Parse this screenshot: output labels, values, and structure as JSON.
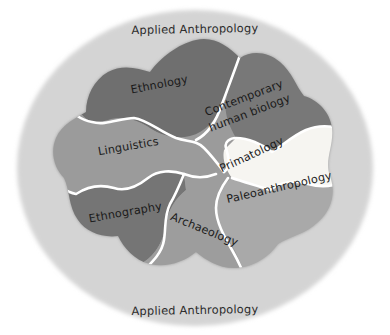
{
  "diagram": {
    "title": "Applied Anthropology",
    "type": "venn-blob-subfield-map",
    "outer_ring": {
      "name": "Applied Anthropology",
      "label_top": "Applied Anthropology",
      "label_bottom": "Applied Anthropology",
      "color": "#d4d4d4"
    },
    "background_color": "#ffffff",
    "divider_color": "#ffffff",
    "regions": [
      {
        "id": "ethnology",
        "label": "Ethnology",
        "color": "#6f6f6f",
        "shade": "dark-gray",
        "rotation": -11,
        "x": 160,
        "y": 88
      },
      {
        "id": "contemporary-human-biology",
        "label_line1": "Contemporary",
        "label_line2": "human biology",
        "label": "Contemporary human biology",
        "color": "#787878",
        "shade": "dark-gray",
        "rotation": -21,
        "x": 247,
        "y": 106
      },
      {
        "id": "linguistics",
        "label": "Linguistics",
        "color": "#9b9b9b",
        "shade": "medium-gray",
        "rotation": -10,
        "x": 129,
        "y": 150
      },
      {
        "id": "primatology",
        "label": "Primatology",
        "color": "#f6f5f1",
        "shade": "near-white",
        "rotation": -25,
        "x": 253,
        "y": 158
      },
      {
        "id": "paleoanthropology",
        "label": "Paleoanthropology",
        "color": "#a9a9a9",
        "shade": "medium-gray",
        "rotation": -13,
        "x": 280,
        "y": 191
      },
      {
        "id": "ethnography",
        "label": "Ethnography",
        "color": "#757575",
        "shade": "dark-gray",
        "rotation": -10,
        "x": 126,
        "y": 216
      },
      {
        "id": "archaeology",
        "label": "Archaeology",
        "color": "#9d9d9d",
        "shade": "medium-gray",
        "rotation": 22,
        "x": 203,
        "y": 233
      }
    ]
  }
}
